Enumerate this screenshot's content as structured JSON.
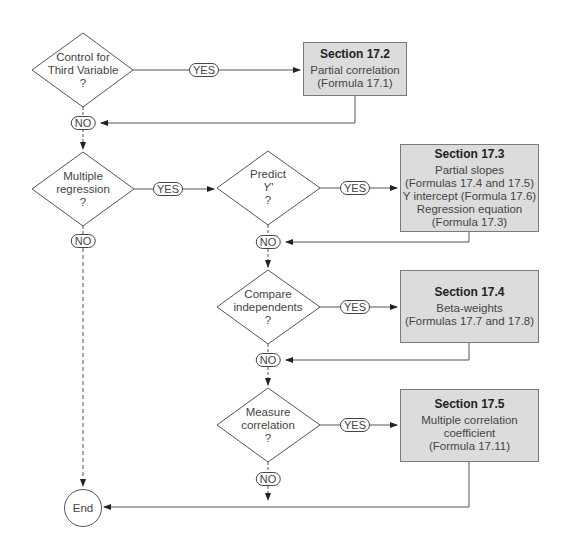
{
  "decisions": [
    {
      "id": "third-variable",
      "lines": [
        "Control for",
        "Third Variable",
        "?"
      ]
    },
    {
      "id": "multiple-regression",
      "lines": [
        "Multiple",
        "regression",
        "?"
      ]
    },
    {
      "id": "predict",
      "lines": [
        "Predict",
        "Y'",
        "?"
      ]
    },
    {
      "id": "compare",
      "lines": [
        "Compare",
        "independents",
        "?"
      ]
    },
    {
      "id": "measure",
      "lines": [
        "Measure",
        "correlation",
        "?"
      ]
    }
  ],
  "sections": [
    {
      "title": "Section 17.2",
      "lines": [
        "Partial correlation",
        "(Formula 17.1)"
      ]
    },
    {
      "title": "Section 17.3",
      "lines": [
        "Partial slopes",
        "(Formulas 17.4 and 17.5)",
        "Y intercept (Formula 17.6)",
        "Regression equation",
        "(Formula 17.3)"
      ]
    },
    {
      "title": "Section 17.4",
      "lines": [
        "Beta-weights",
        "(Formulas 17.7 and 17.8)"
      ]
    },
    {
      "title": "Section 17.5",
      "lines": [
        "Multiple correlation",
        "coefficient",
        "(Formula 17.11)"
      ]
    }
  ],
  "labels": {
    "yes": "YES",
    "no": "NO"
  },
  "end": {
    "label": "End"
  },
  "colors": {
    "box_fill": "#dcdcdc",
    "line": "#555555"
  }
}
